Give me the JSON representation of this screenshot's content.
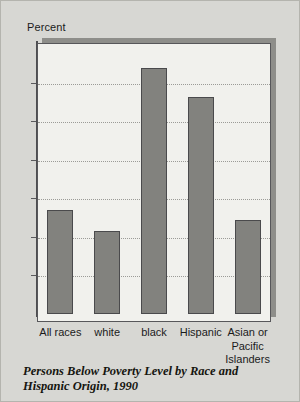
{
  "chart_data": {
    "type": "bar",
    "title": "Persons Below Poverty Level by Race and Hispanic Origin, 1990",
    "xlabel": "",
    "ylabel": "Percent",
    "categories": [
      "All races",
      "white",
      "black",
      "Hispanic",
      "Asian or\nPacific\nIslanders"
    ],
    "values": [
      13.5,
      10.7,
      31.9,
      28.1,
      12.2
    ],
    "ylim": [
      0,
      35
    ],
    "yticks": [
      0,
      5,
      10,
      15,
      20,
      25,
      30,
      35
    ],
    "ytick_labels": [
      "0",
      "5",
      "10",
      "15",
      "20",
      "25",
      "30",
      "35"
    ],
    "grid": true,
    "legend": "none",
    "bar_color": "#82827e",
    "bar_border_color": "#4a4a4c",
    "plot_background": "#f1f1ed",
    "page_background": "#d7d7d3",
    "gridline_color": "#9b9b97"
  },
  "caption": {
    "text": "Persons Below Poverty Level by Race and Hispanic Origin, 1990"
  }
}
